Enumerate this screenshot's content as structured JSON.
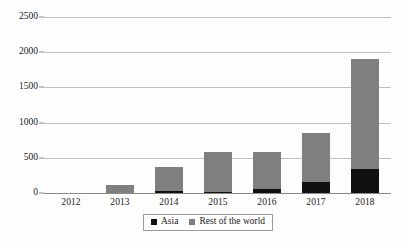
{
  "chart_data": {
    "type": "bar",
    "subtype": "stacked-vertical",
    "title": "",
    "subtitle": "",
    "xlabel": "",
    "ylabel": "",
    "categories": [
      "2012",
      "2013",
      "2014",
      "2015",
      "2016",
      "2017",
      "2018"
    ],
    "series": [
      {
        "name": "Asia",
        "color": "#101010",
        "values": [
          0,
          0,
          25,
          15,
          55,
          150,
          340
        ]
      },
      {
        "name": "Rest of the world",
        "color": "#7f7f7f",
        "values": [
          0,
          120,
          345,
          570,
          525,
          700,
          1570
        ]
      }
    ],
    "totals": [
      0,
      120,
      370,
      585,
      580,
      850,
      1910
    ],
    "ylim": [
      0,
      2500
    ],
    "ytick_values": [
      0,
      500,
      1000,
      1500,
      2000,
      2500
    ],
    "ytick_labels": [
      "0",
      "500",
      "1000",
      "1500",
      "2000",
      "2500"
    ],
    "grid": true,
    "grid_axis": "y",
    "legend_position": "bottom-center"
  },
  "legend": {
    "items": [
      {
        "label": "Asia",
        "swatch": "asia-swatch",
        "color": "#101010"
      },
      {
        "label": "Rest of the world",
        "swatch": "rest-of-world-swatch",
        "color": "#7f7f7f"
      }
    ]
  },
  "colors": {
    "asia": "#101010",
    "rest_of_world": "#7f7f7f",
    "gridline": "#bfbfbf",
    "axis": "#8a8a8a",
    "background": "#fdfdfd",
    "text": "#1a1a1a"
  }
}
